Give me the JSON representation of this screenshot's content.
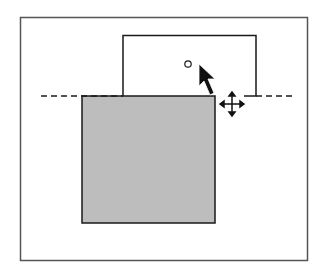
{
  "diagram": {
    "colors": {
      "frame_stroke": "#555555",
      "shape_stroke": "#1a1a1a",
      "filled_shape_fill": "#bdbdbd",
      "guide_stroke": "#1a1a1a",
      "cursor_fill": "#111111",
      "background": "#ffffff"
    },
    "elements": {
      "frame": "canvas-frame",
      "guide": "horizontal-dashed-guide",
      "dragged_outline": "dragged-shape-outline",
      "filled_shape": "original-filled-shape",
      "handle": "snap-point-circle",
      "pointer": "arrow-cursor",
      "move_cursor": "move-cursor"
    }
  }
}
